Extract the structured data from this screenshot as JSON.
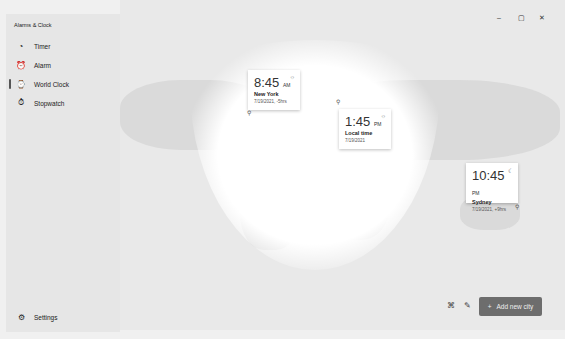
{
  "app": {
    "title": "Alarms & Clock"
  },
  "nav": [
    {
      "label": "Timer",
      "icon": "timer-icon"
    },
    {
      "label": "Alarm",
      "icon": "alarm-icon"
    },
    {
      "label": "World Clock",
      "icon": "world-clock-icon",
      "active": true
    },
    {
      "label": "Stopwatch",
      "icon": "stopwatch-icon"
    }
  ],
  "settings": {
    "label": "Settings"
  },
  "window": {
    "minimize": "–",
    "maximize": "▢",
    "close": "✕"
  },
  "cards": [
    {
      "time": "8:45",
      "ampm": "AM",
      "city": "New York",
      "date": "7/19/2021, -5hrs",
      "icon": "sun-icon"
    },
    {
      "time": "1:45",
      "ampm": "PM",
      "city": "Local time",
      "date": "7/19/2021",
      "icon": "sun-icon"
    },
    {
      "time": "10:45",
      "ampm": "PM",
      "city": "Sydney",
      "date": "7/19/2021, +9hrs",
      "icon": "moon-icon"
    }
  ],
  "toolbar": {
    "add_label": "Add new city",
    "add_icon": "+"
  }
}
